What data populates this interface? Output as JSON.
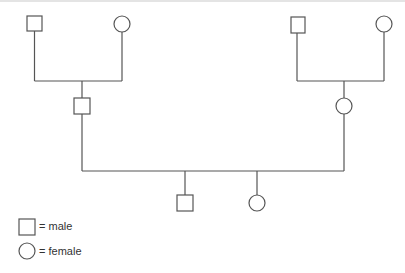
{
  "diagram": {
    "type": "pedigree",
    "line_color": "#555555",
    "generations": [
      {
        "level": 1,
        "individuals": [
          {
            "id": "gp1",
            "sex": "male"
          },
          {
            "id": "gp2",
            "sex": "female"
          },
          {
            "id": "gp3",
            "sex": "male"
          },
          {
            "id": "gp4",
            "sex": "female"
          }
        ]
      },
      {
        "level": 2,
        "individuals": [
          {
            "id": "p1",
            "sex": "male",
            "parents": [
              "gp1",
              "gp2"
            ]
          },
          {
            "id": "p2",
            "sex": "female",
            "parents": [
              "gp3",
              "gp4"
            ]
          }
        ]
      },
      {
        "level": 3,
        "individuals": [
          {
            "id": "c1",
            "sex": "male",
            "parents": [
              "p1",
              "p2"
            ]
          },
          {
            "id": "c2",
            "sex": "female",
            "parents": [
              "p1",
              "p2"
            ]
          }
        ]
      }
    ]
  },
  "legend": {
    "male_label": "= male",
    "female_label": "= female"
  }
}
